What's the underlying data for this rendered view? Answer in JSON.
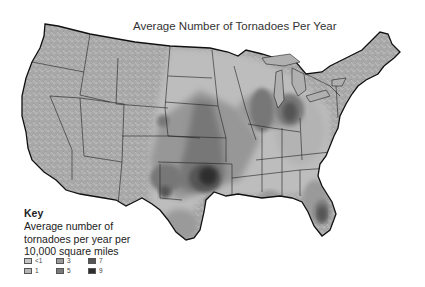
{
  "map": {
    "title": "Average Number of Tornadoes Per Year",
    "region": "Contiguous United States",
    "key": {
      "heading": "Key",
      "description": "Average number of tornadoes per year per 10,000 square miles",
      "items": [
        {
          "label": "<1",
          "color": "#c4c4c4"
        },
        {
          "label": "1",
          "color": "#b5b5b5"
        },
        {
          "label": "3",
          "color": "#9a9a9a"
        },
        {
          "label": "5",
          "color": "#7a7a7a"
        },
        {
          "label": "7",
          "color": "#555555"
        },
        {
          "label": "9",
          "color": "#2e2e2e"
        }
      ]
    },
    "colors": {
      "land": "#aaaaaa",
      "border": "#222222",
      "background": "#ffffff"
    },
    "hotspots": [
      {
        "name": "Oklahoma / Kansas (Tornado Alley)",
        "level": "9"
      },
      {
        "name": "Texas Panhandle",
        "level": "7"
      },
      {
        "name": "Nebraska",
        "level": "5"
      },
      {
        "name": "Illinois / Indiana",
        "level": "7"
      },
      {
        "name": "Central Florida",
        "level": "7"
      },
      {
        "name": "Mississippi / Louisiana",
        "level": "5"
      }
    ]
  }
}
